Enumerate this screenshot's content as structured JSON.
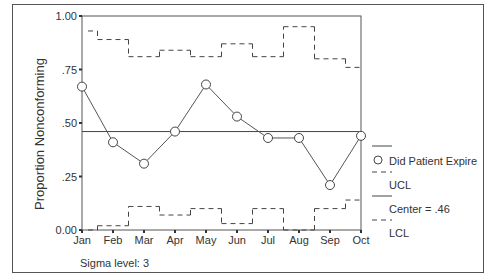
{
  "chart_data": {
    "type": "line",
    "title": "",
    "xlabel": "",
    "ylabel": "Proportion Nonconforming",
    "categories": [
      "Jan",
      "Feb",
      "Mar",
      "Apr",
      "May",
      "Jun",
      "Jul",
      "Aug",
      "Sep",
      "Oct"
    ],
    "ylim": [
      0,
      1
    ],
    "yticks": [
      "0.00",
      ".25",
      ".50",
      ".75",
      "1.00"
    ],
    "series": [
      {
        "name": "Did Patient Expire",
        "values": [
          0.67,
          0.41,
          0.31,
          0.46,
          0.68,
          0.53,
          0.43,
          0.43,
          0.21,
          0.44
        ],
        "style": "line-circle"
      },
      {
        "name": "UCL",
        "values": [
          0.93,
          0.89,
          0.81,
          0.84,
          0.81,
          0.87,
          0.81,
          0.95,
          0.8,
          0.76
        ],
        "style": "dashed-step"
      },
      {
        "name": "Center = .46",
        "values": [
          0.46,
          0.46,
          0.46,
          0.46,
          0.46,
          0.46,
          0.46,
          0.46,
          0.46,
          0.46
        ],
        "style": "solid"
      },
      {
        "name": "LCL",
        "values": [
          0.0,
          0.02,
          0.11,
          0.07,
          0.1,
          0.03,
          0.1,
          0.0,
          0.1,
          0.14
        ],
        "style": "dashed-step"
      }
    ],
    "center": 0.46,
    "legend": [
      "Did Patient Expire",
      "UCL",
      "Center = .46",
      "LCL"
    ],
    "legend_position": "right",
    "grid": false,
    "annotation": "Sigma level: 3"
  },
  "labels": {
    "ylabel": "Proportion Nonconforming",
    "sigma": "Sigma level: 3",
    "legend_series": "Did Patient Expire",
    "legend_ucl": "UCL",
    "legend_center": "Center = .46",
    "legend_lcl": "LCL"
  }
}
